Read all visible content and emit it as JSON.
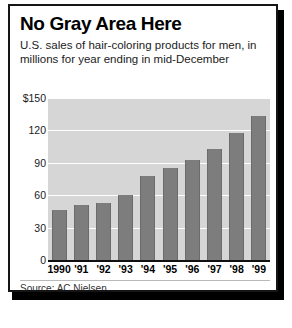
{
  "headline": "No Gray Area Here",
  "subhead": "U.S. sales of hair-coloring products for men, in millions for year ending in mid-December",
  "source": "Source: AC Nielsen",
  "axis": {
    "y_ticks": [
      "$150",
      "120",
      "90",
      "60",
      "30",
      "0"
    ],
    "x_ticks": [
      "1990",
      "'91",
      "'92",
      "'93",
      "'94",
      "'95",
      "'96",
      "'97",
      "'98",
      "'99"
    ]
  },
  "chart_data": {
    "type": "bar",
    "title": "No Gray Area Here",
    "subtitle": "U.S. sales of hair-coloring products for men, in millions for year ending in mid-December",
    "source": "Source: AC Nielsen",
    "categories": [
      "1990",
      "'91",
      "'92",
      "'93",
      "'94",
      "'95",
      "'96",
      "'97",
      "'98",
      "'99"
    ],
    "values": [
      46,
      51,
      53,
      60,
      78,
      85,
      93,
      103,
      118,
      133
    ],
    "xlabel": "",
    "ylabel": "",
    "ylim": [
      0,
      150
    ],
    "yticks": [
      0,
      30,
      60,
      90,
      120,
      150
    ],
    "ytick_labels": [
      "0",
      "30",
      "60",
      "90",
      "120",
      "$150"
    ],
    "units": "millions of dollars",
    "grid": true,
    "legend": false,
    "bar_color": "#7d7d7d",
    "plot_background": "#d6d6d6"
  }
}
